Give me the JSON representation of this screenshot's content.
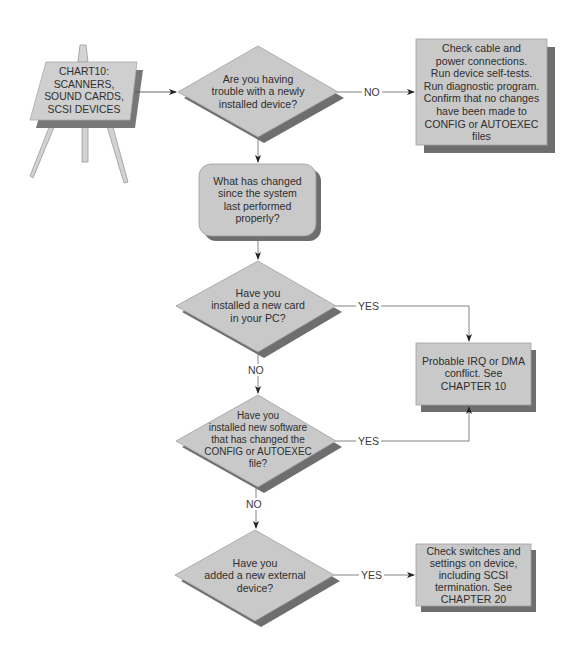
{
  "title_sign": {
    "text": "CHART10:\nSCANNERS,\nSOUND CARDS,\nSCSI DEVICES",
    "icon": "easel-icon"
  },
  "nodes": {
    "q1": {
      "type": "decision",
      "text": "Are you having\ntrouble with a newly\ninstalled device?"
    },
    "a1": {
      "type": "action",
      "text": "Check cable and\npower connections.\nRun device self-tests.\nRun diagnostic program.\nConfirm that no changes\nhave been made to\nCONFIG or AUTOEXEC\nfiles"
    },
    "p1": {
      "type": "process",
      "text": "What has changed\nsince the system\nlast performed\nproperly?"
    },
    "q2": {
      "type": "decision",
      "text": "Have you\ninstalled a new card\nin your PC?"
    },
    "a2": {
      "type": "action",
      "text": "Probable IRQ or DMA\nconflict. See\nCHAPTER 10"
    },
    "q3": {
      "type": "decision",
      "text": "Have you\ninstalled new software\nthat has changed the\nCONFIG or AUTOEXEC\nfile?"
    },
    "q4": {
      "type": "decision",
      "text": "Have you\nadded a new external\ndevice?"
    },
    "a3": {
      "type": "action",
      "text": "Check switches and\nsettings on device,\nincluding SCSI\ntermination. See\nCHAPTER 20"
    }
  },
  "edges": {
    "q1_a1": {
      "label": "NO"
    },
    "q2_a2": {
      "label": "YES"
    },
    "q2_q3": {
      "label": "NO"
    },
    "q3_a2": {
      "label": "YES"
    },
    "q3_q4": {
      "label": "NO"
    },
    "q4_a3": {
      "label": "YES"
    }
  },
  "colors": {
    "shape_fill": "#c9c9c9",
    "shadow": "#6e6e6e",
    "line": "#555555",
    "text": "#2e2e2e"
  }
}
